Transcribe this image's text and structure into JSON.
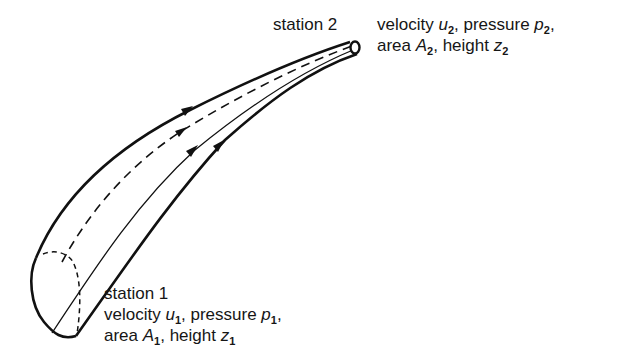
{
  "diagram": {
    "station2": {
      "name": "station 2",
      "line1": {
        "prefix": "velocity ",
        "var1": "u",
        "sub1": "2",
        "mid": ", pressure ",
        "var2": "p",
        "sub2": "2",
        "suffix": ","
      },
      "line2": {
        "prefix": "area ",
        "var1": "A",
        "sub1": "2",
        "mid": ", height ",
        "var2": "z",
        "sub2": "2",
        "suffix": ""
      }
    },
    "station1": {
      "name": "station 1",
      "line1": {
        "prefix": "velocity ",
        "var1": "u",
        "sub1": "1",
        "mid": ", pressure ",
        "var2": "p",
        "sub2": "1",
        "suffix": ","
      },
      "line2": {
        "prefix": "area ",
        "var1": "A",
        "sub1": "1",
        "mid": ", height ",
        "var2": "z",
        "sub2": "1",
        "suffix": ""
      }
    },
    "streamlines": [
      {
        "name": "upper-boundary",
        "style": "solid-thick",
        "arrow": "flow-direction"
      },
      {
        "name": "hidden-streamline",
        "style": "dashed",
        "arrow": "flow-direction"
      },
      {
        "name": "front-streamline",
        "style": "solid-thin",
        "arrow": "flow-direction"
      },
      {
        "name": "lower-boundary",
        "style": "solid-thick",
        "arrow": "flow-direction"
      }
    ],
    "colors": {
      "ink": "#111111",
      "background": "#ffffff"
    }
  }
}
